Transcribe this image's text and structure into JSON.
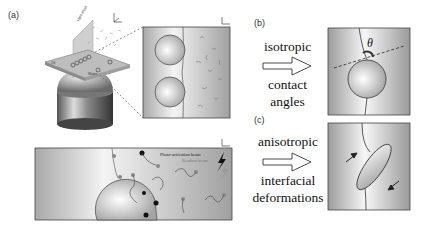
{
  "figure": {
    "panel_a": {
      "label": "(a)",
      "illustration": {
        "light_sheet_label": "Light sheet",
        "oil_label": "Oil",
        "water_label": "Water"
      },
      "bottom_panel": {
        "beam_label_1": "Photo-activation beam",
        "beam_label_2": "Readout beam"
      }
    },
    "panel_b": {
      "label": "(b)",
      "caption_top": "isotropic",
      "caption_bottom_1": "contact",
      "caption_bottom_2": "angles",
      "angle_symbol": "θ"
    },
    "panel_c": {
      "label": "(c)",
      "caption_top": "anisotropic",
      "caption_bottom_1": "interfacial",
      "caption_bottom_2": "deformations"
    }
  },
  "colors": {
    "panel_bg_light": "#f2f2f2",
    "panel_bg_dark": "#9a9a9a",
    "outline": "#333333"
  }
}
